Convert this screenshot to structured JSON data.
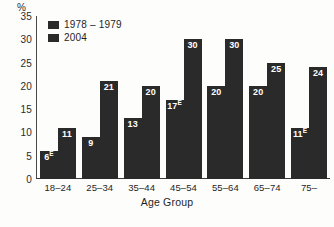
{
  "chart_data": {
    "type": "bar",
    "title": "",
    "xlabel": "Age Group",
    "ylabel": "%",
    "ylim": [
      0,
      35
    ],
    "ytick_step": 5,
    "yticks": [
      "0",
      "5",
      "10",
      "15",
      "20",
      "25",
      "30",
      "35"
    ],
    "grid": false,
    "legend_position": "top-left",
    "categories": [
      "18–24",
      "25–34",
      "35–44",
      "45–54",
      "55–64",
      "65–74",
      "75–"
    ],
    "series": [
      {
        "name": "1978 – 1979",
        "color": "#2a2a2a",
        "values": [
          6,
          9,
          13,
          17,
          20,
          20,
          11
        ],
        "labels": [
          "6",
          "9",
          "13",
          "17",
          "20",
          "20",
          "11"
        ],
        "flags": [
          "E",
          "",
          "",
          "E",
          "",
          "",
          "E"
        ]
      },
      {
        "name": "2004",
        "color": "#2a2a2a",
        "values": [
          11,
          21,
          20,
          30,
          30,
          25,
          24
        ],
        "labels": [
          "11",
          "21",
          "20",
          "30",
          "30",
          "25",
          "24"
        ],
        "flags": [
          "",
          "",
          "",
          "",
          "",
          "",
          ""
        ]
      }
    ]
  },
  "legend": {
    "items": [
      {
        "label": "1978 – 1979",
        "color": "#2a2a2a"
      },
      {
        "label": "2004",
        "color": "#2a2a2a"
      }
    ]
  },
  "axes": {
    "y_unit": "%",
    "x_title": "Age Group"
  }
}
